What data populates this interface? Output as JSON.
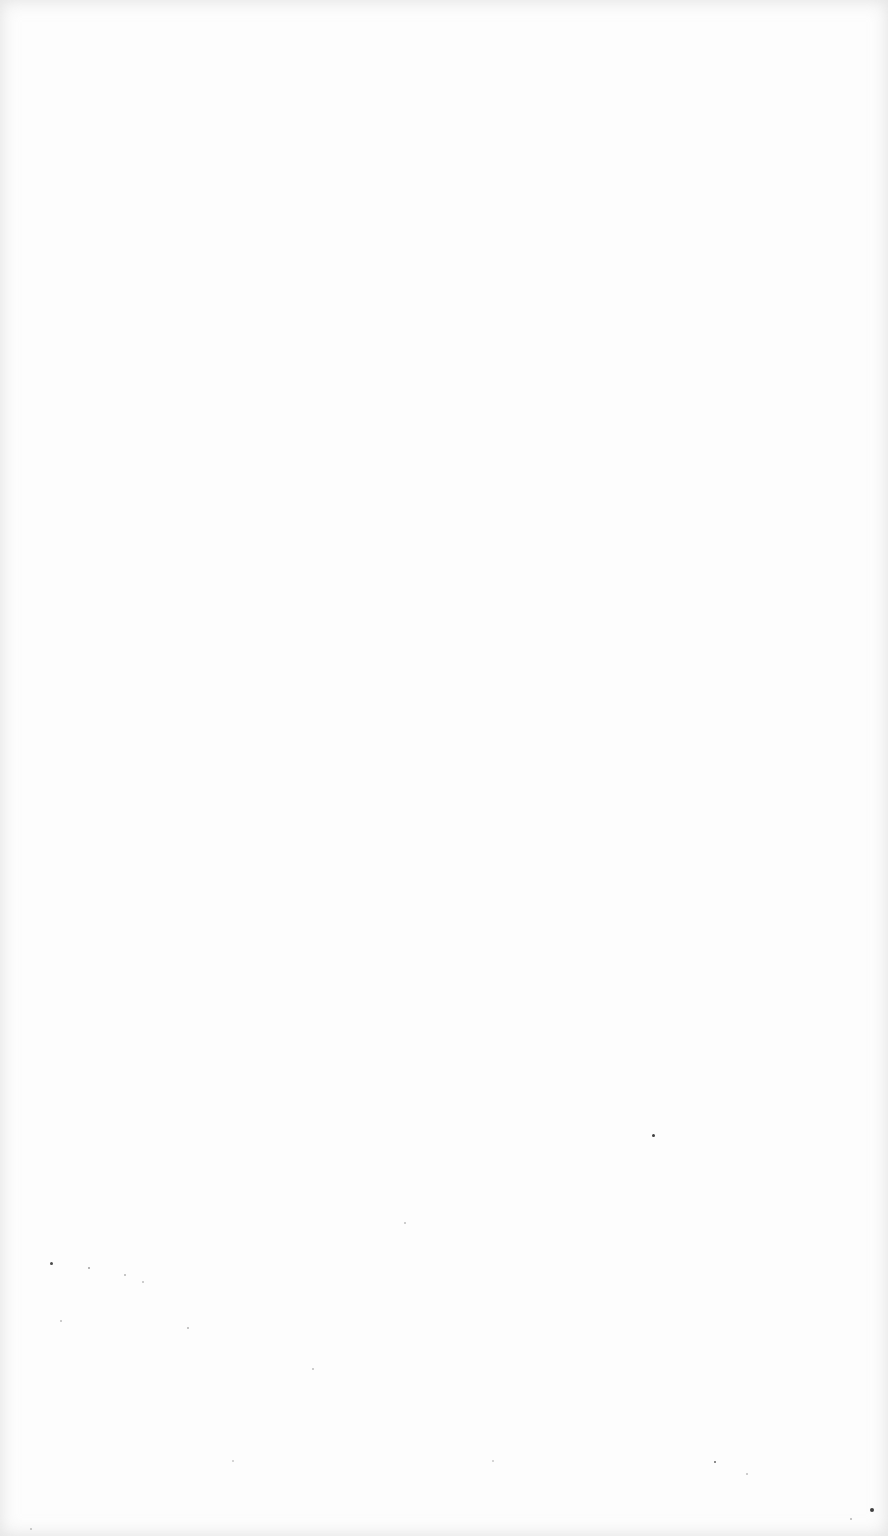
{
  "page": {
    "background": "#fdfdfd",
    "speck_color": "#2a2a2a",
    "specks": [
      {
        "x": 50,
        "y": 1262,
        "size": 3,
        "opacity": 0.85
      },
      {
        "x": 88,
        "y": 1267,
        "size": 2,
        "opacity": 0.45
      },
      {
        "x": 124,
        "y": 1274,
        "size": 2,
        "opacity": 0.35
      },
      {
        "x": 142,
        "y": 1281,
        "size": 2,
        "opacity": 0.3
      },
      {
        "x": 60,
        "y": 1320,
        "size": 2,
        "opacity": 0.3
      },
      {
        "x": 187,
        "y": 1327,
        "size": 2,
        "opacity": 0.35
      },
      {
        "x": 312,
        "y": 1368,
        "size": 2,
        "opacity": 0.3
      },
      {
        "x": 404,
        "y": 1222,
        "size": 2,
        "opacity": 0.3
      },
      {
        "x": 652,
        "y": 1134,
        "size": 3,
        "opacity": 0.9
      },
      {
        "x": 714,
        "y": 1461,
        "size": 2,
        "opacity": 0.7
      },
      {
        "x": 746,
        "y": 1473,
        "size": 2,
        "opacity": 0.3
      },
      {
        "x": 870,
        "y": 1508,
        "size": 4,
        "opacity": 0.9
      },
      {
        "x": 850,
        "y": 1518,
        "size": 2,
        "opacity": 0.35
      },
      {
        "x": 232,
        "y": 1460,
        "size": 2,
        "opacity": 0.25
      },
      {
        "x": 492,
        "y": 1460,
        "size": 2,
        "opacity": 0.25
      },
      {
        "x": 30,
        "y": 1528,
        "size": 2,
        "opacity": 0.3
      }
    ]
  }
}
